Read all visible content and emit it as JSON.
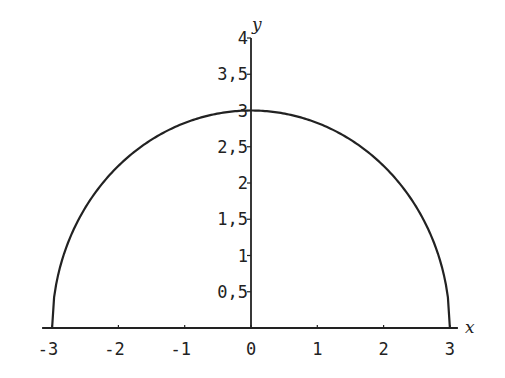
{
  "chart_data": {
    "type": "line",
    "title": "",
    "xlabel": "x",
    "ylabel": "y",
    "xlim": [
      -3,
      3
    ],
    "ylim": [
      0,
      4
    ],
    "grid": false,
    "legend": null,
    "x_ticks": [
      -3,
      -2,
      -1,
      0,
      1,
      2,
      3
    ],
    "x_tick_labels": [
      "-3",
      "-2",
      "-1",
      "0",
      "1",
      "2",
      "3"
    ],
    "y_ticks": [
      0.5,
      1,
      1.5,
      2,
      2.5,
      3,
      3.5,
      4
    ],
    "y_tick_labels": [
      "0,5",
      "1",
      "1,5",
      "2",
      "2,5",
      "3",
      "3,5",
      "4"
    ],
    "series": [
      {
        "name": "y = sqrt(9 - x^2)",
        "x": [
          -3,
          -2.9,
          -2.75,
          -2.5,
          -2.25,
          -2,
          -1.5,
          -1,
          -0.5,
          0,
          0.5,
          1,
          1.5,
          2,
          2.25,
          2.5,
          2.75,
          2.9,
          3
        ],
        "y": [
          0,
          0.768,
          1.199,
          1.658,
          1.984,
          2.236,
          2.598,
          2.828,
          2.958,
          3,
          2.958,
          2.828,
          2.598,
          2.236,
          1.984,
          1.658,
          1.199,
          0.768,
          0
        ]
      }
    ],
    "colors": {
      "line": "#222222",
      "axis": "#222222",
      "background": "#ffffff"
    }
  }
}
